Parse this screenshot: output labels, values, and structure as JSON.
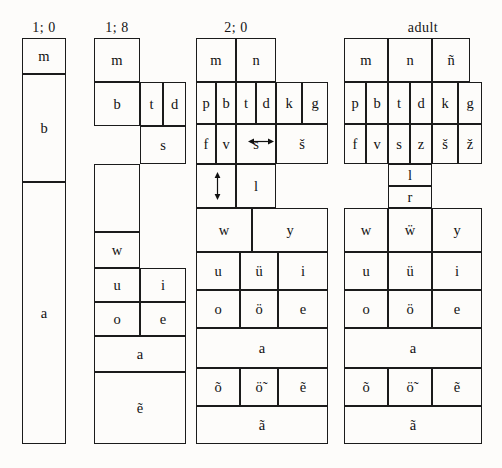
{
  "figure": {
    "type": "phoneme-acquisition-chart"
  },
  "columns": [
    {
      "id": "col-1-0",
      "title": "1; 0",
      "cells": [
        {
          "label": "m",
          "x": 22,
          "y": 38,
          "w": 44,
          "h": 36
        },
        {
          "label": "b",
          "x": 22,
          "y": 74,
          "w": 44,
          "h": 108
        },
        {
          "label": "a",
          "x": 22,
          "y": 182,
          "w": 44,
          "h": 262
        }
      ]
    },
    {
      "id": "col-1-8",
      "title": "1; 8",
      "cells": [
        {
          "label": "m",
          "x": 94,
          "y": 38,
          "w": 46,
          "h": 44
        },
        {
          "label": "b",
          "x": 94,
          "y": 82,
          "w": 46,
          "h": 44
        },
        {
          "label": "t",
          "x": 140,
          "y": 82,
          "w": 23,
          "h": 44
        },
        {
          "label": "d",
          "x": 163,
          "y": 82,
          "w": 23,
          "h": 44
        },
        {
          "label": "s",
          "x": 140,
          "y": 126,
          "w": 46,
          "h": 38
        },
        {
          "label": "",
          "x": 94,
          "y": 164,
          "w": 46,
          "h": 68
        },
        {
          "label": "w",
          "x": 94,
          "y": 232,
          "w": 46,
          "h": 36
        },
        {
          "label": "u",
          "x": 94,
          "y": 268,
          "w": 46,
          "h": 34
        },
        {
          "label": "i",
          "x": 140,
          "y": 268,
          "w": 46,
          "h": 34
        },
        {
          "label": "o",
          "x": 94,
          "y": 302,
          "w": 46,
          "h": 34
        },
        {
          "label": "e",
          "x": 140,
          "y": 302,
          "w": 46,
          "h": 34
        },
        {
          "label": "a",
          "x": 94,
          "y": 336,
          "w": 92,
          "h": 36
        },
        {
          "label": "ẽ",
          "x": 94,
          "y": 372,
          "w": 92,
          "h": 72
        }
      ]
    },
    {
      "id": "col-2-0",
      "title": "2; 0",
      "cells": [
        {
          "label": "m",
          "x": 196,
          "y": 38,
          "w": 40,
          "h": 44
        },
        {
          "label": "n",
          "x": 236,
          "y": 38,
          "w": 40,
          "h": 44
        },
        {
          "label": "p",
          "x": 196,
          "y": 82,
          "w": 20,
          "h": 42
        },
        {
          "label": "b",
          "x": 216,
          "y": 82,
          "w": 20,
          "h": 42
        },
        {
          "label": "t",
          "x": 236,
          "y": 82,
          "w": 20,
          "h": 42
        },
        {
          "label": "d",
          "x": 256,
          "y": 82,
          "w": 20,
          "h": 42
        },
        {
          "label": "k",
          "x": 276,
          "y": 82,
          "w": 26,
          "h": 42
        },
        {
          "label": "g",
          "x": 302,
          "y": 82,
          "w": 26,
          "h": 42
        },
        {
          "label": "f",
          "x": 196,
          "y": 124,
          "w": 20,
          "h": 40
        },
        {
          "label": "v",
          "x": 216,
          "y": 124,
          "w": 20,
          "h": 40
        },
        {
          "label": "s",
          "x": 236,
          "y": 124,
          "w": 40,
          "h": 40
        },
        {
          "label": "š",
          "x": 276,
          "y": 124,
          "w": 52,
          "h": 40
        },
        {
          "label": "",
          "x": 196,
          "y": 164,
          "w": 40,
          "h": 44
        },
        {
          "label": "l",
          "x": 236,
          "y": 164,
          "w": 40,
          "h": 44
        },
        {
          "label": "w",
          "x": 196,
          "y": 208,
          "w": 56,
          "h": 44
        },
        {
          "label": "y",
          "x": 252,
          "y": 208,
          "w": 76,
          "h": 44
        },
        {
          "label": "u",
          "x": 196,
          "y": 252,
          "w": 44,
          "h": 38
        },
        {
          "label": "ü",
          "x": 240,
          "y": 252,
          "w": 38,
          "h": 38
        },
        {
          "label": "i",
          "x": 278,
          "y": 252,
          "w": 50,
          "h": 38
        },
        {
          "label": "o",
          "x": 196,
          "y": 290,
          "w": 44,
          "h": 38
        },
        {
          "label": "ö",
          "x": 240,
          "y": 290,
          "w": 38,
          "h": 38
        },
        {
          "label": "e",
          "x": 278,
          "y": 290,
          "w": 50,
          "h": 38
        },
        {
          "label": "a",
          "x": 196,
          "y": 328,
          "w": 132,
          "h": 40
        },
        {
          "label": "õ",
          "x": 196,
          "y": 368,
          "w": 44,
          "h": 38
        },
        {
          "label": "ö̃",
          "x": 240,
          "y": 368,
          "w": 38,
          "h": 38
        },
        {
          "label": "ẽ",
          "x": 278,
          "y": 368,
          "w": 50,
          "h": 38
        },
        {
          "label": "ã",
          "x": 196,
          "y": 406,
          "w": 132,
          "h": 38
        }
      ]
    },
    {
      "id": "col-adult",
      "title": "adult",
      "cells": [
        {
          "label": "m",
          "x": 344,
          "y": 38,
          "w": 44,
          "h": 44
        },
        {
          "label": "n",
          "x": 388,
          "y": 38,
          "w": 44,
          "h": 44
        },
        {
          "label": "ñ",
          "x": 432,
          "y": 38,
          "w": 38,
          "h": 44
        },
        {
          "label": "p",
          "x": 344,
          "y": 82,
          "w": 22,
          "h": 42
        },
        {
          "label": "b",
          "x": 366,
          "y": 82,
          "w": 22,
          "h": 42
        },
        {
          "label": "t",
          "x": 388,
          "y": 82,
          "w": 22,
          "h": 42
        },
        {
          "label": "d",
          "x": 410,
          "y": 82,
          "w": 22,
          "h": 42
        },
        {
          "label": "k",
          "x": 432,
          "y": 82,
          "w": 26,
          "h": 42
        },
        {
          "label": "g",
          "x": 458,
          "y": 82,
          "w": 24,
          "h": 42
        },
        {
          "label": "f",
          "x": 344,
          "y": 124,
          "w": 22,
          "h": 40
        },
        {
          "label": "v",
          "x": 366,
          "y": 124,
          "w": 22,
          "h": 40
        },
        {
          "label": "s",
          "x": 388,
          "y": 124,
          "w": 22,
          "h": 40
        },
        {
          "label": "z",
          "x": 410,
          "y": 124,
          "w": 22,
          "h": 40
        },
        {
          "label": "š",
          "x": 432,
          "y": 124,
          "w": 26,
          "h": 40
        },
        {
          "label": "ž",
          "x": 458,
          "y": 124,
          "w": 24,
          "h": 40
        },
        {
          "label": "l",
          "x": 388,
          "y": 164,
          "w": 44,
          "h": 22
        },
        {
          "label": "r",
          "x": 388,
          "y": 186,
          "w": 44,
          "h": 22
        },
        {
          "label": "w",
          "x": 344,
          "y": 208,
          "w": 44,
          "h": 44
        },
        {
          "label": "ẅ",
          "x": 388,
          "y": 208,
          "w": 44,
          "h": 44
        },
        {
          "label": "y",
          "x": 432,
          "y": 208,
          "w": 50,
          "h": 44
        },
        {
          "label": "u",
          "x": 344,
          "y": 252,
          "w": 44,
          "h": 38
        },
        {
          "label": "ü",
          "x": 388,
          "y": 252,
          "w": 44,
          "h": 38
        },
        {
          "label": "i",
          "x": 432,
          "y": 252,
          "w": 50,
          "h": 38
        },
        {
          "label": "o",
          "x": 344,
          "y": 290,
          "w": 44,
          "h": 38
        },
        {
          "label": "ö",
          "x": 388,
          "y": 290,
          "w": 44,
          "h": 38
        },
        {
          "label": "e",
          "x": 432,
          "y": 290,
          "w": 50,
          "h": 38
        },
        {
          "label": "a",
          "x": 344,
          "y": 328,
          "w": 138,
          "h": 40
        },
        {
          "label": "õ",
          "x": 344,
          "y": 368,
          "w": 44,
          "h": 38
        },
        {
          "label": "ö̃",
          "x": 388,
          "y": 368,
          "w": 44,
          "h": 38
        },
        {
          "label": "ẽ",
          "x": 432,
          "y": 368,
          "w": 50,
          "h": 38
        },
        {
          "label": "ã",
          "x": 344,
          "y": 406,
          "w": 138,
          "h": 38
        }
      ]
    }
  ],
  "titles": [
    {
      "text": "1; 0",
      "x": 22,
      "y": 20,
      "w": 44
    },
    {
      "text": "1; 8",
      "x": 94,
      "y": 20,
      "w": 46
    },
    {
      "text": "2; 0",
      "x": 196,
      "y": 20,
      "w": 80
    },
    {
      "text": "adult",
      "x": 388,
      "y": 20,
      "w": 70
    }
  ],
  "arrows": [
    {
      "name": "horizontal-double-arrow",
      "orientation": "horizontal",
      "x": 248,
      "y": 136,
      "len": 26
    },
    {
      "name": "vertical-double-arrow",
      "orientation": "vertical",
      "x": 212,
      "y": 172,
      "len": 28
    }
  ]
}
